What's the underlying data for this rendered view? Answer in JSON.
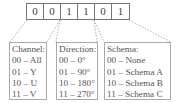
{
  "bits": [
    "0",
    "0",
    "1",
    "1",
    "0",
    "1"
  ],
  "legends": [
    {
      "title": "Channel:",
      "rows": [
        "00 – All",
        "01 – Y",
        "10 – U",
        "11 – V"
      ]
    },
    {
      "title": "Direction:",
      "rows": [
        "00 – 0°",
        "01 – 90°",
        "10 – 180°",
        "11 – 270°"
      ]
    },
    {
      "title": "Schema:",
      "rows": [
        "00 – None",
        "01 – Schema A",
        "10 – Schema B",
        "11 – Schema C"
      ]
    }
  ],
  "colors": {
    "box_border": "#777777",
    "legend_border": "#aaaaaa",
    "dash_line": "#999999",
    "text": "#555555"
  }
}
